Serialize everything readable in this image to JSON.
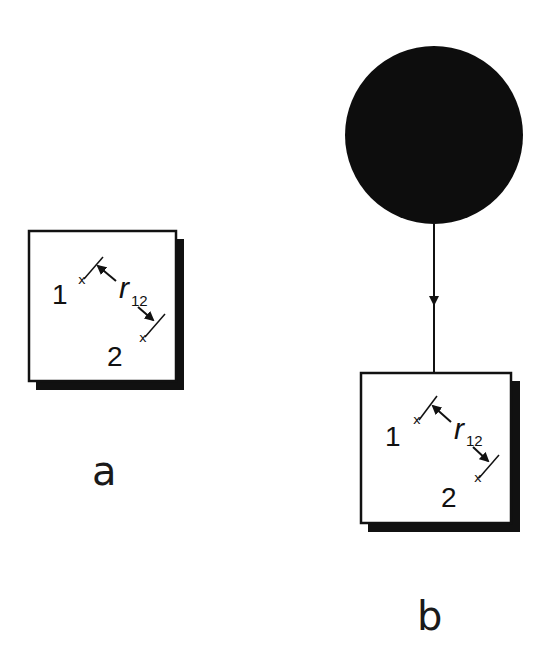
{
  "panels": [
    {
      "id": "a",
      "caption": "a",
      "box": {
        "particle_1_label": "1",
        "particle_2_label": "2",
        "distance_symbol": "r",
        "distance_subscript": "12",
        "point_mark": "x"
      }
    },
    {
      "id": "b",
      "caption": "b",
      "source": {
        "shape": "filled-circle",
        "color": "#0d0d0d"
      },
      "connector": {
        "direction": "down",
        "arrow": true
      },
      "box": {
        "particle_1_label": "1",
        "particle_2_label": "2",
        "distance_symbol": "r",
        "distance_subscript": "12",
        "point_mark": "x"
      }
    }
  ],
  "colors": {
    "line": "#111111",
    "shadow": "#111111",
    "background": "#ffffff",
    "fill_circle": "#0d0d0d"
  }
}
